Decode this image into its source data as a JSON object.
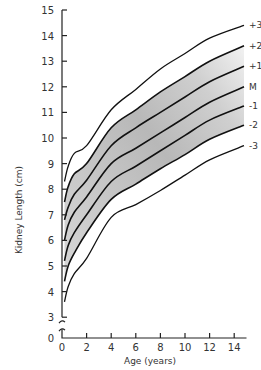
{
  "chart_data": {
    "type": "line",
    "title": "",
    "xlabel": "Age (years)",
    "ylabel": "Kidney Length (cm)",
    "xlim": [
      0,
      15
    ],
    "ylim": [
      0,
      15
    ],
    "y_axis_break": [
      0,
      3
    ],
    "grid": false,
    "legend_position": "right, inline labels at line ends",
    "x_ticks": [
      0,
      2,
      4,
      6,
      8,
      10,
      12,
      14
    ],
    "y_ticks": [
      0,
      3,
      4,
      5,
      6,
      7,
      8,
      9,
      10,
      11,
      12,
      13,
      14,
      15
    ],
    "shaded_band": {
      "from_series": "-2",
      "to_series": "+2",
      "color": "#bdbdbd"
    },
    "x": [
      0.2,
      0.5,
      1,
      2,
      4,
      6,
      8,
      10,
      12,
      14.8
    ],
    "series": [
      {
        "name": "+3",
        "values": [
          8.3,
          8.9,
          9.4,
          9.7,
          11.1,
          11.9,
          12.7,
          13.3,
          13.9,
          14.4
        ]
      },
      {
        "name": "+2",
        "values": [
          7.5,
          8.1,
          8.6,
          9.0,
          10.4,
          11.1,
          11.8,
          12.4,
          13.0,
          13.6
        ]
      },
      {
        "name": "+1",
        "values": [
          6.8,
          7.3,
          7.8,
          8.35,
          9.7,
          10.4,
          11.0,
          11.6,
          12.2,
          12.8
        ]
      },
      {
        "name": "M",
        "values": [
          6.0,
          6.6,
          7.1,
          7.7,
          9.0,
          9.6,
          10.2,
          10.8,
          11.4,
          12.0
        ]
      },
      {
        "name": "-1",
        "values": [
          5.2,
          5.8,
          6.3,
          7.0,
          8.3,
          8.9,
          9.5,
          10.1,
          10.7,
          11.25
        ]
      },
      {
        "name": "-2",
        "values": [
          4.4,
          5.0,
          5.5,
          6.3,
          7.6,
          8.2,
          8.8,
          9.35,
          9.95,
          10.5
        ]
      },
      {
        "name": "-3",
        "values": [
          3.6,
          4.2,
          4.7,
          5.3,
          6.9,
          7.4,
          7.95,
          8.55,
          9.15,
          9.7
        ]
      }
    ]
  },
  "labels": {
    "xlabel": "Age (years)",
    "ylabel": "Kidney Length (cm)"
  }
}
